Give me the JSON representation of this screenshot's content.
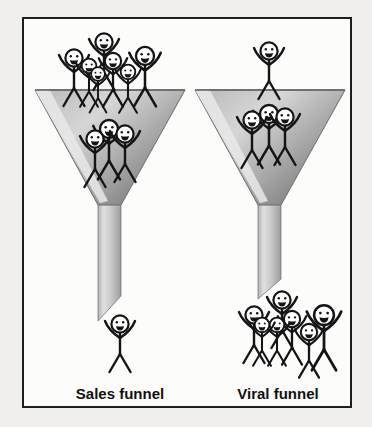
{
  "labels": {
    "sales": "Sales funnel",
    "viral": "Viral funnel"
  },
  "colors": {
    "page_bg": "#f1efec",
    "frame_bg": "#fcfcfb",
    "frame_border": "#1e1e1e",
    "ink": "#141414",
    "funnel_outline": "#6b6b6b",
    "bowl_top": "#b9b9b9",
    "bowl_mid": "#d6d6d6",
    "bowl_dark": "#858585",
    "bevel": "#e9e9e9",
    "stem_l": "#b3b3b3",
    "stem_hl": "#e0e0e0",
    "stem_m": "#c6c6c6",
    "stem_r": "#9d9d9d",
    "label_color": "#111111"
  },
  "diagram": {
    "type": "funnel-comparison",
    "funnels": [
      {
        "id": "sales",
        "label": "Sales funnel",
        "people_entering_top": 7,
        "people_inside_bowl": 3,
        "people_exiting_bottom": 1
      },
      {
        "id": "viral",
        "label": "Viral funnel",
        "people_entering_top": 1,
        "people_inside_bowl": 3,
        "people_exiting_bottom": 7
      }
    ],
    "figure_groups": [
      {
        "id": "sales-top",
        "figures": [
          {
            "x": 80,
            "y": 23,
            "s": 1.0
          },
          {
            "x": 50,
            "y": 39,
            "s": 1.0
          },
          {
            "x": 121,
            "y": 37,
            "s": 1.05
          },
          {
            "x": 89,
            "y": 42,
            "s": 0.95
          },
          {
            "x": 65,
            "y": 47,
            "s": 0.85
          },
          {
            "x": 104,
            "y": 53,
            "s": 0.85
          },
          {
            "x": 74,
            "y": 55,
            "s": 0.8
          }
        ]
      },
      {
        "id": "sales-mid",
        "figures": [
          {
            "x": 85,
            "y": 110,
            "s": 1.05
          },
          {
            "x": 71,
            "y": 120,
            "s": 1.0
          },
          {
            "x": 101,
            "y": 115,
            "s": 1.0
          }
        ]
      },
      {
        "id": "sales-out",
        "figures": [
          {
            "x": 96,
            "y": 305,
            "s": 1.0
          }
        ]
      },
      {
        "id": "viral-top",
        "figures": [
          {
            "x": 245,
            "y": 32,
            "s": 1.0
          }
        ]
      },
      {
        "id": "viral-mid",
        "figures": [
          {
            "x": 245,
            "y": 95,
            "s": 1.05
          },
          {
            "x": 228,
            "y": 101,
            "s": 1.0
          },
          {
            "x": 261,
            "y": 98,
            "s": 1.0
          }
        ]
      },
      {
        "id": "viral-out",
        "figures": [
          {
            "x": 258,
            "y": 281,
            "s": 1.0
          },
          {
            "x": 230,
            "y": 296,
            "s": 1.0
          },
          {
            "x": 300,
            "y": 296,
            "s": 1.15
          },
          {
            "x": 268,
            "y": 300,
            "s": 0.95
          },
          {
            "x": 253,
            "y": 306,
            "s": 0.85
          },
          {
            "x": 238,
            "y": 306,
            "s": 0.85
          },
          {
            "x": 285,
            "y": 313,
            "s": 0.95
          }
        ]
      }
    ]
  }
}
